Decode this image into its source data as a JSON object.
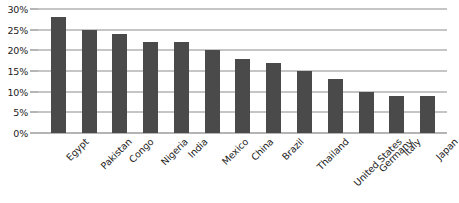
{
  "chart_data": {
    "type": "bar",
    "title": "",
    "xlabel": "",
    "ylabel": "",
    "categories": [
      "Egypt",
      "Pakistan",
      "Congo",
      "Nigeria",
      "India",
      "Mexico",
      "China",
      "Brazil",
      "Thailand",
      "United States",
      "Germany",
      "Italy",
      "Japan"
    ],
    "values": [
      28,
      25,
      24,
      22,
      22,
      20,
      18,
      17,
      15,
      13,
      10,
      9,
      9
    ],
    "ylim": [
      0,
      30
    ],
    "ytick_labels": [
      "0%",
      "5%",
      "10%",
      "15%",
      "20%",
      "25%",
      "30%"
    ],
    "ytick_values": [
      0,
      5,
      10,
      15,
      20,
      25,
      30
    ],
    "grid": "horizontal",
    "legend": "none",
    "bar_color": "#4a4a4a",
    "gridline_color": "#8c8c8c",
    "background_color": "#ffffff"
  }
}
